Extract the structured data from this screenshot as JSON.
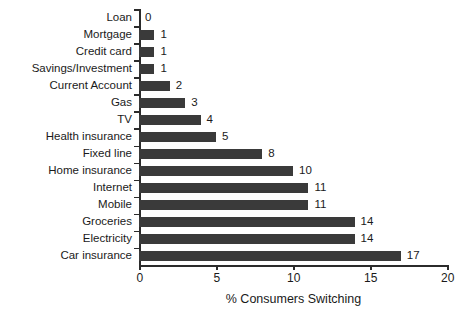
{
  "chart_data": {
    "type": "bar",
    "orientation": "horizontal",
    "title": "",
    "xlabel": "% Consumers Switching",
    "ylabel": "",
    "xlim": [
      0,
      20
    ],
    "xticks": [
      0,
      5,
      10,
      15,
      20
    ],
    "grid": false,
    "legend": null,
    "bar_color": "#3a3a3a",
    "axis_color": "#2b2b2b",
    "text_color": "#1a1a1a",
    "value_labels": true,
    "categories": [
      "Loan",
      "Mortgage",
      "Credit card",
      "Savings/Investment",
      "Current Account",
      "Gas",
      "TV",
      "Health insurance",
      "Fixed line",
      "Home insurance",
      "Internet",
      "Mobile",
      "Groceries",
      "Electricity",
      "Car insurance"
    ],
    "values": [
      0,
      1,
      1,
      1,
      2,
      3,
      4,
      5,
      8,
      10,
      11,
      11,
      14,
      14,
      17
    ],
    "points": [
      {
        "category": "Loan",
        "value": 0,
        "label": "0"
      },
      {
        "category": "Mortgage",
        "value": 1,
        "label": "1"
      },
      {
        "category": "Credit card",
        "value": 1,
        "label": "1"
      },
      {
        "category": "Savings/Investment",
        "value": 1,
        "label": "1"
      },
      {
        "category": "Current Account",
        "value": 2,
        "label": "2"
      },
      {
        "category": "Gas",
        "value": 3,
        "label": "3"
      },
      {
        "category": "TV",
        "value": 4,
        "label": "4"
      },
      {
        "category": "Health insurance",
        "value": 5,
        "label": "5"
      },
      {
        "category": "Fixed line",
        "value": 8,
        "label": "8"
      },
      {
        "category": "Home insurance",
        "value": 10,
        "label": "10"
      },
      {
        "category": "Internet",
        "value": 11,
        "label": "11"
      },
      {
        "category": "Mobile",
        "value": 11,
        "label": "11"
      },
      {
        "category": "Groceries",
        "value": 14,
        "label": "14"
      },
      {
        "category": "Electricity",
        "value": 14,
        "label": "14"
      },
      {
        "category": "Car insurance",
        "value": 17,
        "label": "17"
      }
    ],
    "xtick_labels": [
      "0",
      "5",
      "10",
      "15",
      "20"
    ]
  }
}
